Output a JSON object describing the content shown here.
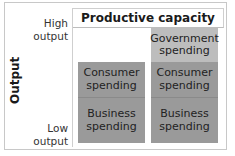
{
  "diagram": {
    "header_title": "Productive capacity",
    "axis_title": "Output",
    "y_labels": {
      "high": [
        "High",
        "output"
      ],
      "low": [
        "Low",
        "output"
      ]
    },
    "columns": [
      {
        "name": "left",
        "blocks": [
          {
            "label": [
              "Consumer",
              "spending"
            ],
            "shade": "#9a9a9a"
          },
          {
            "label": [
              "Business",
              "spending"
            ],
            "shade": "#9a9a9a"
          }
        ]
      },
      {
        "name": "right",
        "blocks": [
          {
            "label": [
              "Government",
              "spending"
            ],
            "shade": "#bdbdbd"
          },
          {
            "label": [
              "Consumer",
              "spending"
            ],
            "shade": "#9a9a9a"
          },
          {
            "label": [
              "Business",
              "spending"
            ],
            "shade": "#9a9a9a"
          }
        ]
      }
    ]
  }
}
